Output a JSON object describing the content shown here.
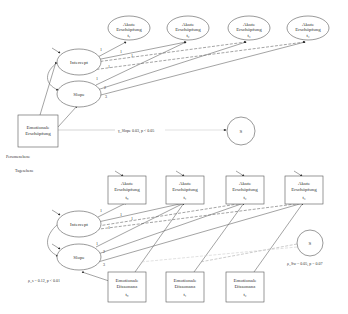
{
  "person_level": {
    "label": "Personenebene",
    "acute_exhaustion": [
      {
        "title": "Akute",
        "title2": "Erschöpfung",
        "t": "t₁"
      },
      {
        "title": "Akute",
        "title2": "Erschöpfung",
        "t": "t₂"
      },
      {
        "title": "Akute",
        "title2": "Erschöpfung",
        "t": "t₃"
      },
      {
        "title": "Akute",
        "title2": "Erschöpfung",
        "t": "t₄"
      }
    ],
    "intercept": "Intercept",
    "slope": "Slope",
    "predictor": {
      "line1": "Emotionale",
      "line2": "Erschöpfung"
    },
    "s_node": "S",
    "path_label": "γ_Slope  0.03, p < 0.05",
    "loadings_intercept": [
      "1",
      "1",
      "1",
      "1"
    ],
    "loadings_slope": [
      "1",
      "2",
      "3"
    ]
  },
  "day_level": {
    "label": "Tagesebene",
    "acute_exhaustion": [
      {
        "title": "Akute",
        "title2": "Erschöpfung",
        "t": "t₀"
      },
      {
        "title": "Akute",
        "title2": "Erschöpfung",
        "t": "t₁"
      },
      {
        "title": "Akute",
        "title2": "Erschöpfung",
        "t": "t₂"
      },
      {
        "title": "Akute",
        "title2": "Erschöpfung",
        "t": "t₃"
      }
    ],
    "intercept": "Intercept",
    "slope": "Slope",
    "dissonance": [
      {
        "line1": "Emotionale",
        "line2": "Dissonanz",
        "t": "t₀"
      },
      {
        "line1": "Emotionale",
        "line2": "Dissonanz",
        "t": "t₁"
      },
      {
        "line1": "Emotionale",
        "line2": "Dissonanz",
        "t": "t₂"
      }
    ],
    "s_node": "S",
    "left_annotation": "ρ_s = 0.12, p < 0.01",
    "right_annotation": "ρ_Sw = 0.05, p = 0.07",
    "loadings_intercept": [
      "1",
      "1",
      "1",
      "1"
    ],
    "loadings_slope": [
      "1",
      "2",
      "3"
    ]
  }
}
